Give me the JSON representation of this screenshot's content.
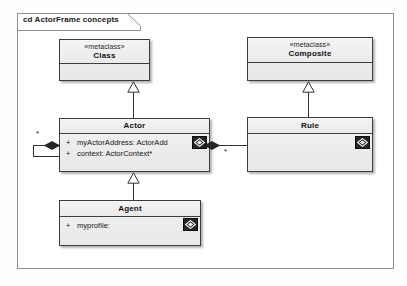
{
  "diagram": {
    "frame_label": "cd ActorFrame concepts",
    "classes": [
      {
        "id": "class",
        "stereotype": "«metaclass»",
        "name": "Class",
        "attributes": []
      },
      {
        "id": "composite",
        "stereotype": "«metaclass»",
        "name": "Composite",
        "attributes": []
      },
      {
        "id": "actor",
        "stereotype": "",
        "name": "Actor",
        "attributes": [
          {
            "visibility": "+",
            "text": "myActorAddress: ActorAdd"
          },
          {
            "visibility": "+",
            "text": "context: ActorContext*"
          }
        ],
        "badge": "diamond-badge-icon"
      },
      {
        "id": "rule",
        "stereotype": "",
        "name": "Rule",
        "attributes": [],
        "badge": "diamond-badge-icon"
      },
      {
        "id": "agent",
        "stereotype": "",
        "name": "Agent",
        "attributes": [
          {
            "visibility": "+",
            "text": "myprofile:"
          }
        ],
        "badge": "diamond-badge-icon"
      }
    ],
    "relationships": [
      {
        "type": "generalization",
        "from": "Actor",
        "to": "Class"
      },
      {
        "type": "generalization",
        "from": "Rule",
        "to": "Composite"
      },
      {
        "type": "generalization",
        "from": "Agent",
        "to": "Actor"
      },
      {
        "type": "composition",
        "from": "Actor",
        "to": "Actor",
        "multiplicity": "*"
      },
      {
        "type": "composition",
        "from": "Actor",
        "to": "Rule",
        "multiplicity": "*"
      }
    ],
    "multiplicities": {
      "actor_self": "*",
      "actor_rule": "*"
    },
    "colors": {
      "box_fill": "#eeeeee",
      "box_border": "#3d3d3d",
      "line": "#333333",
      "badge": "#262626",
      "frame_border": "#8e8e8e",
      "canvas": "#ffffff"
    }
  }
}
